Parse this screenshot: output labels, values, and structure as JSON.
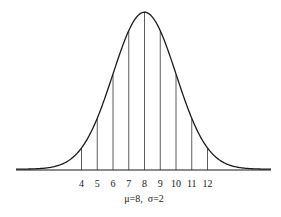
{
  "chart_data": {
    "type": "line",
    "title": "",
    "subtitle": "Normal distribution curve",
    "caption": "μ=8,  σ=2",
    "mu": 8,
    "sigma": 2,
    "xlabel": "",
    "ylabel": "",
    "x_ticks": [
      4,
      5,
      6,
      7,
      8,
      9,
      10,
      11,
      12
    ],
    "xlim": [
      -0.2,
      16.1
    ],
    "grid": false,
    "legend": null,
    "vertical_lines_at": [
      4,
      5,
      6,
      7,
      8,
      9,
      10,
      11,
      12
    ],
    "colors": {
      "curve": "#1a1a1a",
      "lines": "#333333",
      "axis": "#1a1a1a"
    }
  },
  "labels": {
    "caption_mu": "μ=8,",
    "caption_sigma": "σ=2"
  }
}
